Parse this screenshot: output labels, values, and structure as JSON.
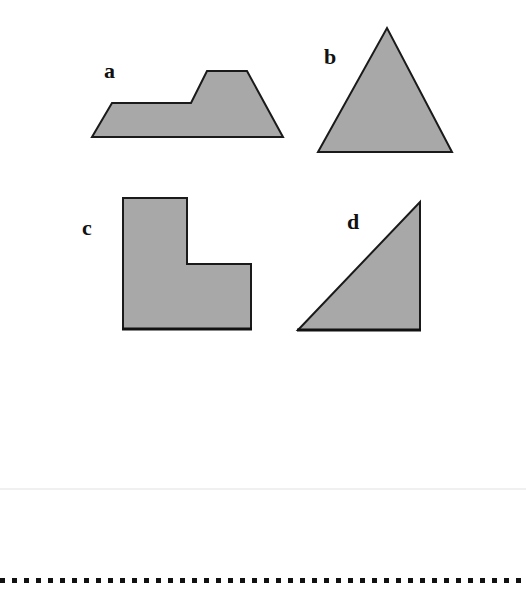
{
  "worksheet": {
    "shapes": [
      {
        "id": "a",
        "label": "a",
        "kind": "step-trapezoid",
        "points": "92,137 112,103 191,103 207,71 247,71 283,137"
      },
      {
        "id": "b",
        "label": "b",
        "kind": "triangle",
        "points": "318,152 387,28 452,152"
      },
      {
        "id": "c",
        "label": "c",
        "kind": "L-shape",
        "points": "123,198 187,198 187,264 251,264 251,329 123,329"
      },
      {
        "id": "d",
        "label": "d",
        "kind": "right-triangle",
        "points": "298,330 420,202 420,330"
      }
    ],
    "colors": {
      "fill": "#a8a8a8",
      "stroke": "#1a1a1a",
      "label": "#111111",
      "dots": "#111111"
    },
    "separator": "dotted-line"
  }
}
